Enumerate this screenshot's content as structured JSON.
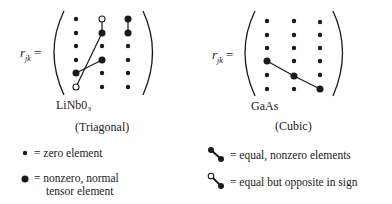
{
  "left_panel": {
    "symbol": "r",
    "subscript": "jk",
    "equals": "=",
    "material": "LiNb0₃",
    "crystal_class": "(Triagonal)",
    "matrix": {
      "rows": 6,
      "cols": 3,
      "large_dots": [
        [
          1,
          1
        ],
        [
          0,
          2
        ],
        [
          1,
          2
        ],
        [
          3,
          1
        ],
        [
          4,
          0
        ]
      ],
      "open_dots": [
        [
          0,
          1
        ],
        [
          5,
          0
        ]
      ],
      "links": [
        {
          "from": [
            0,
            1
          ],
          "to": [
            1,
            1
          ],
          "type": "opposite"
        },
        {
          "from": [
            1,
            1
          ],
          "to": [
            5,
            0
          ],
          "type": "opposite"
        },
        {
          "from": [
            3,
            1
          ],
          "to": [
            4,
            0
          ],
          "type": "equal"
        },
        {
          "from": [
            0,
            2
          ],
          "to": [
            1,
            2
          ],
          "type": "equal"
        }
      ]
    }
  },
  "right_panel": {
    "symbol": "r",
    "subscript": "jk",
    "equals": "=",
    "material": "GaAs",
    "crystal_class": "(Cubic)",
    "matrix": {
      "rows": 6,
      "cols": 3,
      "large_dots": [
        [
          3,
          0
        ],
        [
          4,
          1
        ],
        [
          5,
          2
        ]
      ],
      "open_dots": [],
      "links": [
        {
          "from": [
            3,
            0
          ],
          "to": [
            4,
            1
          ],
          "type": "equal"
        },
        {
          "from": [
            4,
            1
          ],
          "to": [
            5,
            2
          ],
          "type": "equal"
        }
      ]
    }
  },
  "legend": {
    "zero": "= zero element",
    "nonzero_line1": "= nonzero, normal",
    "nonzero_line2": "tensor element",
    "equal": "= equal, nonzero elements",
    "opposite": "= equal but opposite in sign"
  },
  "colors": {
    "ink": "#1a1a1a",
    "background": "#ffffff"
  }
}
